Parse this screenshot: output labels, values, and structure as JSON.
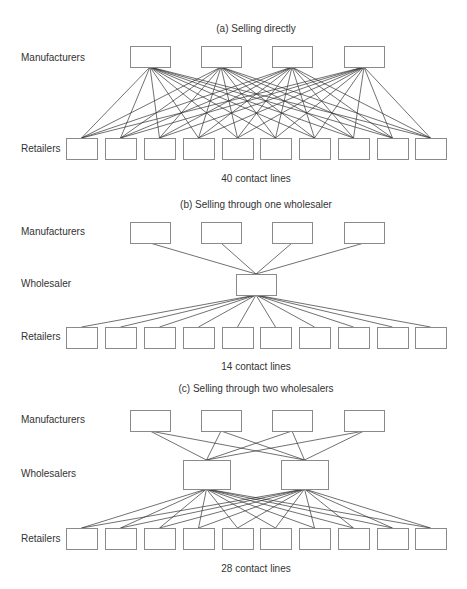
{
  "colors": {
    "line": "#333333",
    "box_stroke": "#8a8a8a",
    "text": "#333333",
    "background": "#ffffff"
  },
  "panels": [
    {
      "id": "a",
      "title": "(a) Selling directly",
      "caption": "40 contact lines",
      "title_y": 23,
      "caption_y": 173,
      "rows": [
        {
          "label": "Manufacturers",
          "label_y": 52,
          "y": 46,
          "h": 21,
          "boxes_x": [
            130,
            201,
            272,
            344
          ],
          "w": 40
        },
        {
          "label": "Retailers",
          "label_y": 143,
          "y": 138,
          "h": 21,
          "boxes_x": [
            66,
            105,
            144,
            183,
            222,
            260,
            299,
            338,
            377,
            415
          ],
          "w": 31
        }
      ],
      "connections": [
        {
          "from_row": 0,
          "to_row": 1,
          "mode": "all"
        }
      ]
    },
    {
      "id": "b",
      "title": "(b) Selling through one wholesaler",
      "caption": "14 contact lines",
      "title_y": 199,
      "caption_y": 361,
      "rows": [
        {
          "label": "Manufacturers",
          "label_y": 226,
          "y": 222,
          "h": 21,
          "boxes_x": [
            130,
            201,
            272,
            344
          ],
          "w": 40
        },
        {
          "label": "Wholesaler",
          "label_y": 278,
          "y": 274,
          "h": 21,
          "boxes_x": [
            236
          ],
          "w": 40
        },
        {
          "label": "Retailers",
          "label_y": 331,
          "y": 327,
          "h": 21,
          "boxes_x": [
            66,
            105,
            144,
            183,
            222,
            260,
            299,
            338,
            377,
            415
          ],
          "w": 31
        }
      ],
      "connections": [
        {
          "from_row": 0,
          "to_row": 1,
          "mode": "all"
        },
        {
          "from_row": 1,
          "to_row": 2,
          "mode": "all"
        }
      ]
    },
    {
      "id": "c",
      "title": "(c) Selling through two wholesalers",
      "caption": "28 contact lines",
      "title_y": 383,
      "caption_y": 563,
      "rows": [
        {
          "label": "Manufacturers",
          "label_y": 414,
          "y": 410,
          "h": 21,
          "boxes_x": [
            130,
            201,
            272,
            344
          ],
          "w": 40
        },
        {
          "label": "Wholesalers",
          "label_y": 468,
          "y": 460,
          "h": 29,
          "boxes_x": [
            183,
            281
          ],
          "w": 47
        },
        {
          "label": "Retailers",
          "label_y": 533,
          "y": 528,
          "h": 21,
          "boxes_x": [
            66,
            105,
            144,
            183,
            222,
            260,
            299,
            338,
            377,
            415
          ],
          "w": 31
        }
      ],
      "connections": [
        {
          "from_row": 0,
          "to_row": 1,
          "mode": "all"
        },
        {
          "from_row": 1,
          "to_row": 2,
          "mode": "all"
        }
      ]
    }
  ]
}
